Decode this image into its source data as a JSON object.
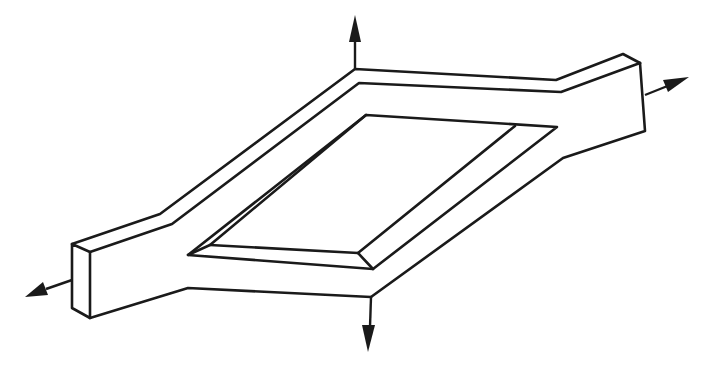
{
  "figure": {
    "description": "Isometric line drawing of a rectangular frame-shaped plate specimen with tabs extended at two opposite corners; arrows indicate biaxial loading (up, down, left, right).",
    "colors": {
      "background": "#ffffff",
      "line": "#1a1a1a"
    },
    "arrows": [
      {
        "name": "load-up",
        "direction": "up"
      },
      {
        "name": "load-right",
        "direction": "right"
      },
      {
        "name": "load-down",
        "direction": "down"
      },
      {
        "name": "load-left",
        "direction": "left"
      }
    ]
  }
}
